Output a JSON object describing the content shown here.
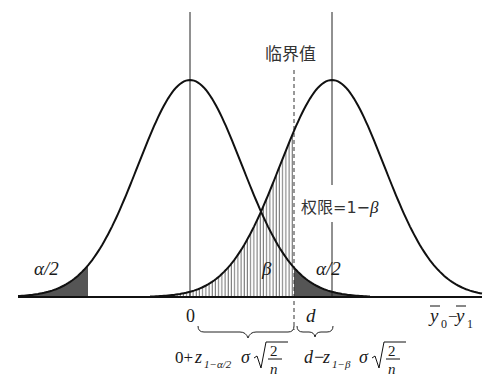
{
  "diagram": {
    "critical_value_label": "临界值",
    "power_label": "权限=1−",
    "power_beta": "β",
    "left_tail_label": "α/2",
    "right_tail_label": "α/2",
    "beta_label": "β",
    "zero_label": "0",
    "d_label": "d",
    "axis_label": {
      "y0": "y",
      "sub0": "0",
      "dash": "−",
      "y1": "y",
      "sub1": "1"
    },
    "left_formula": {
      "prefix": "0+",
      "z": "z",
      "sub": "1−α/2",
      "sigma": "σ",
      "num": "2",
      "den": "n"
    },
    "right_formula": {
      "prefix": "d−",
      "z": "z",
      "sub": "1−β",
      "sigma": "σ",
      "num": "2",
      "den": "n"
    },
    "colors": {
      "curve": "#111111",
      "shade": "#555555",
      "hatch": "#333333"
    }
  }
}
